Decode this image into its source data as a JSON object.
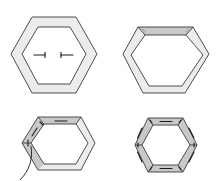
{
  "diagram": {
    "colors": {
      "background": "#ffffff",
      "outline": "#3a3a3a",
      "fabric_light": "#ececec",
      "fabric_folded": "#c9c9c9",
      "stitch": "#1a1a1a"
    },
    "steps": [
      {
        "id": 1,
        "label": "hexagon frame with center arrows",
        "arrows": [
          "right",
          "left"
        ]
      },
      {
        "id": 2,
        "label": "top edge folded over"
      },
      {
        "id": 3,
        "label": "edges basted with thread"
      },
      {
        "id": 4,
        "label": "all six edges basted"
      }
    ]
  }
}
